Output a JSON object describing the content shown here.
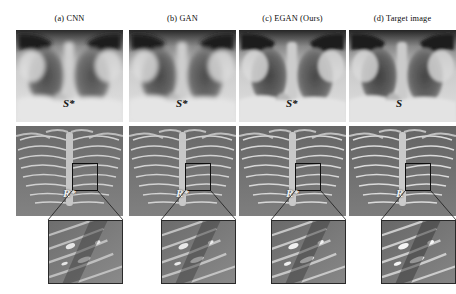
{
  "figure": {
    "background": "#ffffff",
    "width": 456,
    "height": 294,
    "rows": [
      {
        "id": "soft-tissue",
        "name": "soft tissue image row"
      },
      {
        "id": "bone",
        "name": "bone image row"
      },
      {
        "id": "inset",
        "name": "zoomed region-of-interest row"
      }
    ]
  },
  "panels": [
    {
      "caption": "(a) CNN",
      "soft_label": "S*",
      "bone_label": "R*",
      "left": 16
    },
    {
      "caption": "(b) GAN",
      "soft_label": "S*",
      "bone_label": "R*",
      "left": 129
    },
    {
      "caption": "(c) EGAN (Ours)",
      "soft_label": "S*",
      "bone_label": "R*",
      "left": 239
    },
    {
      "caption": "(d) Target image",
      "soft_label": "S",
      "bone_label": "R",
      "left": 349
    }
  ],
  "colors": {
    "background": "#ffffff",
    "caption_text": "#0b0b0b",
    "soft_label_text": "#141414",
    "bone_label_text": "#f2f2f2",
    "roi_border": "#0e0e0e",
    "inset_border": "#2a2a2a",
    "connector_line": "#1a1a1a"
  }
}
